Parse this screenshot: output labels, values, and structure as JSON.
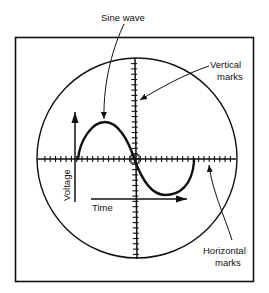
{
  "diagram": {
    "type": "oscilloscope-screen",
    "colors": {
      "ink": "#111111",
      "background": "#ffffff"
    },
    "labels": {
      "sine_wave": "Sine wave",
      "vertical_marks_line1": "Vertical",
      "vertical_marks_line2": "marks",
      "horizontal_marks_line1": "Horizontal",
      "horizontal_marks_line2": "marks",
      "voltage": "Voltage",
      "time": "Time"
    },
    "geometry": {
      "frame": {
        "x": 15,
        "y": 37,
        "width": 239,
        "height": 245
      },
      "screen_circle": {
        "cx": 137,
        "cy": 158,
        "r": 100
      },
      "axis_center": {
        "x": 135,
        "y": 159
      },
      "tick_spacing": 5.3,
      "tick_half_length": 3
    }
  }
}
